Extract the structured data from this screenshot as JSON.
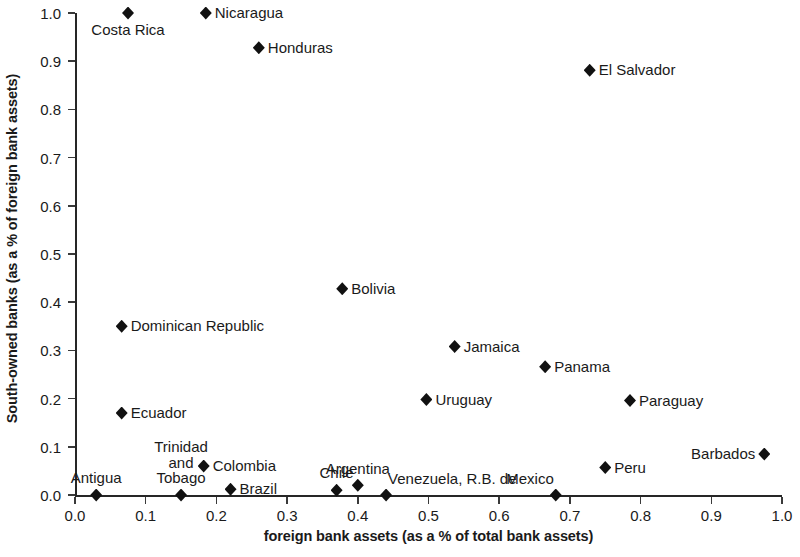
{
  "chart_data": {
    "type": "scatter",
    "title": "",
    "xlabel": "foreign bank assets (as a % of total bank assets)",
    "ylabel": "South-owned banks (as a % of foreign bank assets)",
    "xlim": [
      0.0,
      1.0
    ],
    "ylim": [
      0.0,
      1.0
    ],
    "grid": false,
    "legend": "none",
    "marker": "filled-diamond",
    "marker_color": "#111111",
    "xticks": [
      "0.0",
      "0.1",
      "0.2",
      "0.3",
      "0.4",
      "0.5",
      "0.6",
      "0.7",
      "0.8",
      "0.9",
      "1.0"
    ],
    "xtick_values": [
      0.0,
      0.1,
      0.2,
      0.3,
      0.4,
      0.5,
      0.6,
      0.7,
      0.8,
      0.9,
      1.0
    ],
    "yticks": [
      "0.0",
      "0.1",
      "0.2",
      "0.3",
      "0.4",
      "0.5",
      "0.6",
      "0.7",
      "0.8",
      "0.9",
      "1.0"
    ],
    "ytick_values": [
      0.0,
      0.1,
      0.2,
      0.3,
      0.4,
      0.5,
      0.6,
      0.7,
      0.8,
      0.9,
      1.0
    ],
    "points": [
      {
        "label": "Costa Rica",
        "x": 0.075,
        "y": 1.0,
        "label_pos": "below"
      },
      {
        "label": "Nicaragua",
        "x": 0.185,
        "y": 1.0,
        "label_pos": "right"
      },
      {
        "label": "Honduras",
        "x": 0.26,
        "y": 0.928,
        "label_pos": "right"
      },
      {
        "label": "El Salvador",
        "x": 0.728,
        "y": 0.881,
        "label_pos": "right"
      },
      {
        "label": "Bolivia",
        "x": 0.378,
        "y": 0.428,
        "label_pos": "right"
      },
      {
        "label": "Dominican Republic",
        "x": 0.066,
        "y": 0.35,
        "label_pos": "right"
      },
      {
        "label": "Jamaica",
        "x": 0.537,
        "y": 0.308,
        "label_pos": "right"
      },
      {
        "label": "Panama",
        "x": 0.665,
        "y": 0.266,
        "label_pos": "right"
      },
      {
        "label": "Uruguay",
        "x": 0.497,
        "y": 0.198,
        "label_pos": "right"
      },
      {
        "label": "Paraguay",
        "x": 0.785,
        "y": 0.196,
        "label_pos": "right"
      },
      {
        "label": "Ecuador",
        "x": 0.066,
        "y": 0.17,
        "label_pos": "right"
      },
      {
        "label": "Barbados",
        "x": 0.975,
        "y": 0.085,
        "label_pos": "left"
      },
      {
        "label": "Trinidad\nand\nTobago",
        "x": 0.15,
        "y": 0.0,
        "label_pos": "above"
      },
      {
        "label": "Colombia",
        "x": 0.182,
        "y": 0.06,
        "label_pos": "right"
      },
      {
        "label": "Peru",
        "x": 0.75,
        "y": 0.057,
        "label_pos": "right"
      },
      {
        "label": "Argentina",
        "x": 0.4,
        "y": 0.02,
        "label_pos": "above"
      },
      {
        "label": "Brazil",
        "x": 0.22,
        "y": 0.012,
        "label_pos": "right"
      },
      {
        "label": "Chile",
        "x": 0.37,
        "y": 0.01,
        "label_pos": "above"
      },
      {
        "label": "Antigua",
        "x": 0.03,
        "y": 0.0,
        "label_pos": "above"
      },
      {
        "label": "Venezuela, R.B. de",
        "x": 0.44,
        "y": 0.0,
        "label_pos": "above-right"
      },
      {
        "label": "Mexico",
        "x": 0.68,
        "y": 0.0,
        "label_pos": "above-left"
      }
    ]
  }
}
